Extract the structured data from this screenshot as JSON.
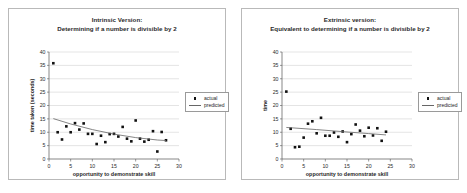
{
  "page": {
    "background": "#ffffff",
    "marker_color": "#111111",
    "trend_color": "#666666",
    "grid_color": "#c9c9c9",
    "axis_color": "#555555"
  },
  "legend": {
    "actual_label": "actual",
    "predicted_label": "predicted",
    "marker_icon": "square-marker-icon",
    "line_icon": "trend-line-icon"
  },
  "charts": [
    {
      "id": "chart-left",
      "title_line1": "Intrinsic Version:",
      "title_line2": "Determining if a number is divisible by 2"
    },
    {
      "id": "chart-right",
      "title_line1": "Extrinsic version:",
      "title_line2": "Equivalent to determining if a number is divisible by 2"
    }
  ],
  "chart_data": [
    {
      "type": "scatter",
      "title": "Intrinsic Version: Determining if a number is divisible by 2",
      "xlabel": "opportunity to demonstrate skill",
      "ylabel": "time taken (seconds)",
      "xlim": [
        0,
        30
      ],
      "ylim": [
        0,
        40
      ],
      "xticks": [
        0,
        5,
        10,
        15,
        20,
        25,
        30
      ],
      "yticks": [
        0,
        5,
        10,
        15,
        20,
        25,
        30,
        35,
        40
      ],
      "grid": "horizontal",
      "legend_position": "right",
      "series": [
        {
          "name": "actual",
          "marker": "square",
          "points": [
            [
              1.0,
              35.8
            ],
            [
              2.0,
              10.0
            ],
            [
              3.0,
              7.3
            ],
            [
              4.0,
              12.2
            ],
            [
              5.0,
              10.0
            ],
            [
              6.0,
              13.4
            ],
            [
              7.0,
              11.0
            ],
            [
              8.0,
              13.3
            ],
            [
              9.0,
              9.4
            ],
            [
              10.0,
              9.4
            ],
            [
              11.0,
              5.6
            ],
            [
              12.0,
              8.7
            ],
            [
              13.0,
              6.3
            ],
            [
              14.0,
              9.3
            ],
            [
              15.0,
              9.4
            ],
            [
              16.0,
              8.4
            ],
            [
              17.0,
              12.0
            ],
            [
              18.0,
              7.6
            ],
            [
              19.0,
              6.6
            ],
            [
              20.0,
              14.4
            ],
            [
              21.0,
              7.6
            ],
            [
              22.0,
              6.5
            ],
            [
              23.0,
              7.2
            ],
            [
              24.0,
              10.4
            ],
            [
              25.0,
              2.8
            ],
            [
              26.0,
              10.1
            ],
            [
              27.0,
              7.0
            ]
          ]
        },
        {
          "name": "predicted",
          "type": "line",
          "points": [
            [
              1.0,
              15.1
            ],
            [
              5.0,
              13.1
            ],
            [
              10.0,
              11.0
            ],
            [
              15.0,
              9.3
            ],
            [
              20.0,
              8.0
            ],
            [
              25.0,
              7.1
            ],
            [
              27.0,
              6.9
            ]
          ]
        }
      ]
    },
    {
      "type": "scatter",
      "title": "Extrinsic version: Equivalent to determining if a number is divisible by 2",
      "xlabel": "opportunity to demonstrate skill",
      "ylabel": "time",
      "xlim": [
        0,
        30
      ],
      "ylim": [
        0,
        40
      ],
      "xticks": [
        0,
        5,
        10,
        15,
        20,
        25,
        30
      ],
      "yticks": [
        0,
        5,
        10,
        15,
        20,
        25,
        30,
        35,
        40
      ],
      "grid": "horizontal",
      "legend_position": "right",
      "series": [
        {
          "name": "actual",
          "marker": "square",
          "points": [
            [
              1.0,
              25.2
            ],
            [
              2.0,
              11.3
            ],
            [
              3.0,
              4.4
            ],
            [
              4.0,
              4.6
            ],
            [
              5.0,
              8.0
            ],
            [
              6.0,
              13.2
            ],
            [
              7.0,
              14.1
            ],
            [
              8.0,
              9.6
            ],
            [
              9.0,
              15.4
            ],
            [
              10.0,
              8.7
            ],
            [
              11.0,
              8.7
            ],
            [
              12.0,
              9.9
            ],
            [
              13.0,
              8.3
            ],
            [
              14.0,
              10.3
            ],
            [
              15.0,
              6.3
            ],
            [
              16.0,
              9.3
            ],
            [
              17.0,
              12.9
            ],
            [
              18.0,
              10.6
            ],
            [
              19.0,
              8.5
            ],
            [
              20.0,
              11.7
            ],
            [
              21.0,
              8.8
            ],
            [
              22.0,
              11.5
            ],
            [
              23.0,
              6.8
            ],
            [
              24.0,
              10.2
            ]
          ]
        },
        {
          "name": "predicted",
          "type": "line",
          "points": [
            [
              1.0,
              11.8
            ],
            [
              8.0,
              11.0
            ],
            [
              15.0,
              10.1
            ],
            [
              20.0,
              9.5
            ],
            [
              24.0,
              9.0
            ]
          ]
        }
      ]
    }
  ]
}
